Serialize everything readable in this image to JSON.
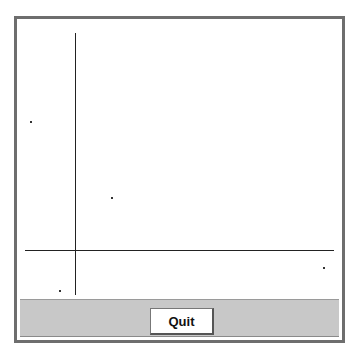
{
  "window": {
    "button": {
      "quit_label": "Quit"
    }
  },
  "plot": {
    "axes": {
      "vertical_line": {
        "x": 75,
        "y1": 30,
        "y2": 292
      },
      "horizontal_line": {
        "y": 247,
        "x1": 25,
        "x2": 334
      }
    },
    "points": [
      {
        "x": 30,
        "y": 118
      },
      {
        "x": 111,
        "y": 194
      },
      {
        "x": 59,
        "y": 287
      },
      {
        "x": 323,
        "y": 264
      }
    ]
  },
  "colors": {
    "frame": "#6e6e6e",
    "panel": "#c8c8c8",
    "line": "#222222"
  }
}
